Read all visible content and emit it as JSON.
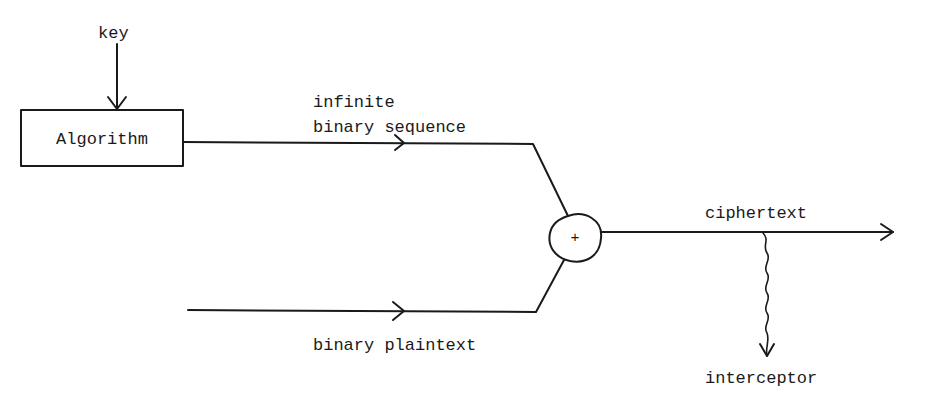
{
  "diagram": {
    "title": "",
    "nodes": [
      {
        "id": "key",
        "label": "key",
        "kind": "input-label"
      },
      {
        "id": "algorithm",
        "label": "Algorithm",
        "kind": "box"
      },
      {
        "id": "xor",
        "label": "+",
        "kind": "combiner-circle"
      },
      {
        "id": "interceptor",
        "label": "interceptor",
        "kind": "output-label"
      }
    ],
    "edges": [
      {
        "from": "key",
        "to": "algorithm",
        "style": "arrow"
      },
      {
        "from": "algorithm",
        "to": "xor",
        "label_line1": "infinite",
        "label_line2": "binary sequence",
        "style": "arrow"
      },
      {
        "from": "plaintext-source",
        "to": "xor",
        "label": "binary plaintext",
        "style": "arrow"
      },
      {
        "from": "xor",
        "to": "output",
        "label": "ciphertext",
        "style": "arrow"
      },
      {
        "from": "ciphertext-line",
        "to": "interceptor",
        "style": "wavy-arrow"
      }
    ]
  },
  "labels": {
    "key": "key",
    "algorithm": "Algorithm",
    "stream_line1": "infinite",
    "stream_line2": "binary sequence",
    "plus": "+",
    "ciphertext": "ciphertext",
    "plaintext": "binary plaintext",
    "interceptor": "interceptor"
  }
}
